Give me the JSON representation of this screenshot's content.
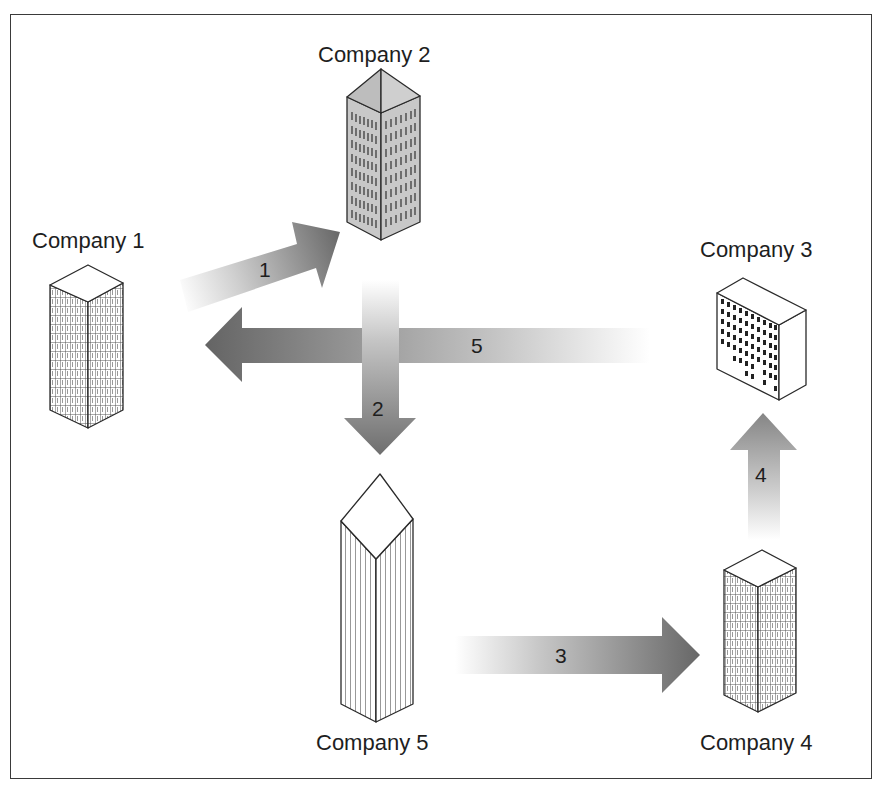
{
  "diagram": {
    "title": "",
    "companies": [
      {
        "id": 1,
        "label": "Company 1"
      },
      {
        "id": 2,
        "label": "Company 2"
      },
      {
        "id": 3,
        "label": "Company 3"
      },
      {
        "id": 4,
        "label": "Company 4"
      },
      {
        "id": 5,
        "label": "Company 5"
      }
    ],
    "flows": [
      {
        "label": "1",
        "from": "Company 1",
        "to": "Company 2"
      },
      {
        "label": "2",
        "from": "Company 2",
        "to": "Company 5"
      },
      {
        "label": "3",
        "from": "Company 5",
        "to": "Company 4"
      },
      {
        "label": "4",
        "from": "Company 4",
        "to": "Company 3"
      },
      {
        "label": "5",
        "from": "Company 3",
        "to": "Company 1"
      }
    ],
    "colors": {
      "arrow_dark": "#6a6a6a",
      "arrow_light": "#ffffff",
      "outline": "#2a2a2a",
      "building2_fill": "#c8c8c8"
    }
  }
}
